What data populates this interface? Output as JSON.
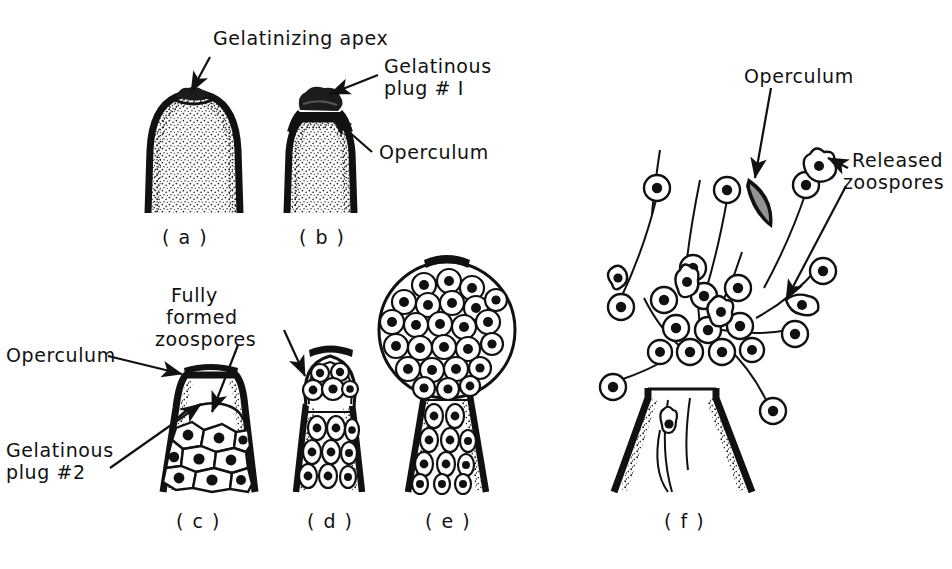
{
  "figure": {
    "background_color": "#ffffff",
    "ink_color": "#111111"
  },
  "labels": {
    "gelatinizing_apex": "Gelatinizing apex",
    "gelatinous_plug_1_line1": "Gelatinous",
    "gelatinous_plug_1_line2": "plug # I",
    "operculum_b": "Operculum",
    "operculum_c": "Operculum",
    "fully_formed_line1": "Fully",
    "fully_formed_line2": "formed",
    "fully_formed_line3": "zoospores",
    "gelatinous_plug_2_line1": "Gelatinous",
    "gelatinous_plug_2_line2": "plug #2",
    "operculum_f": "Operculum",
    "released_zoospores_line1": "Released",
    "released_zoospores_line2": "zoospores"
  },
  "panels": [
    {
      "id": "a",
      "caption": "( a )",
      "description": "Sporangium apex gelatinizing, undifferentiated stippled cytoplasm"
    },
    {
      "id": "b",
      "caption": "( b )",
      "description": "Gelatinous plug #1 formed above operculum"
    },
    {
      "id": "c",
      "caption": "( c )",
      "description": "Operculum with gelatinous plug #2 and fully formed polygonal zoospores"
    },
    {
      "id": "d",
      "caption": "( d )",
      "description": "Zoospore mass beginning to extrude through the opened apex"
    },
    {
      "id": "e",
      "caption": "( e )",
      "description": "Large spherical vesicle of zoospores extruded above the sporangium"
    },
    {
      "id": "f",
      "caption": "( f )",
      "description": "Empty sporangium with operculum detached and zoospores swimming away"
    }
  ],
  "icons": {
    "arrow": "leader-arrow",
    "operculum_detached": "crescent-operculum",
    "zoospore": "zoospore-cell"
  }
}
